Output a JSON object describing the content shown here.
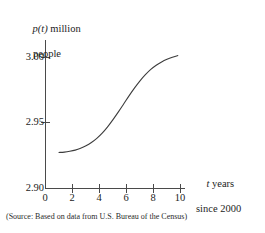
{
  "chart_data": {
    "type": "line",
    "title": "",
    "subtitle": "",
    "ylabel_line1": "p(t) million",
    "ylabel_line2": "people",
    "ylabel": "p(t) million people",
    "xlabel_line1": "t years",
    "xlabel_line2": "since 2000",
    "xlabel": "t years since 2000",
    "xlim": [
      0,
      10.6
    ],
    "ylim": [
      2.9,
      3.013
    ],
    "xticks": [
      0,
      2,
      4,
      6,
      8,
      10
    ],
    "xtick_labels": [
      "0",
      "2",
      "4",
      "6",
      "8",
      "10"
    ],
    "yticks": [
      2.9,
      2.95,
      3.0
    ],
    "ytick_labels": [
      "2.90",
      "2.95",
      "3.00"
    ],
    "grid": false,
    "legend": false,
    "line_color": "#3c3c3c",
    "axis_color": "#4a4a4a",
    "series": [
      {
        "name": "p(t)",
        "x": [
          1.0,
          1.4,
          1.8,
          2.2,
          2.6,
          3.0,
          3.4,
          3.8,
          4.2,
          4.6,
          5.0,
          5.4,
          5.8,
          6.2,
          6.6,
          7.0,
          7.4,
          7.8,
          8.2,
          8.6,
          9.0,
          9.4,
          9.8
        ],
        "values": [
          2.9275,
          2.9278,
          2.9284,
          2.9293,
          2.9307,
          2.9326,
          2.9351,
          2.9383,
          2.9423,
          2.9471,
          2.9526,
          2.9585,
          2.9647,
          2.9709,
          2.9768,
          2.9822,
          2.9869,
          2.9909,
          2.9941,
          2.9966,
          2.9986,
          3.0002,
          3.0015
        ]
      }
    ],
    "annotations": {
      "source": "(Source: Based on data from U.S. Bureau of the Census)"
    }
  },
  "source_note": "(Source: Based on data from U.S. Bureau of the Census)"
}
